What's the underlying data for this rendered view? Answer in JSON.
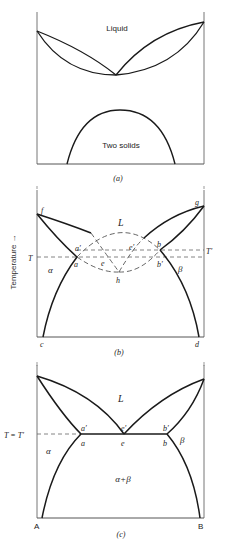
{
  "figure": {
    "panels": [
      {
        "id": "a",
        "caption": "(a)",
        "labels": {
          "liquid": "Liquid",
          "two_solids": "Two solids"
        }
      },
      {
        "id": "b",
        "caption": "(b)",
        "axis_label": "Temperature →",
        "labels": {
          "L": "L",
          "alpha": "α",
          "beta": "β",
          "T": "T",
          "T_prime": "T′",
          "f": "f",
          "g": "g",
          "c": "c",
          "d": "d",
          "a": "a",
          "a_prime": "a′",
          "b": "b",
          "b_prime": "b′",
          "e": "e",
          "e_prime": "e′",
          "h": "h"
        }
      },
      {
        "id": "c",
        "caption": "(c)",
        "labels": {
          "L": "L",
          "alpha": "α",
          "beta": "β",
          "alpha_beta": "α+β",
          "T_eq": "T = T′",
          "a": "a",
          "a_prime": "a′",
          "e": "e",
          "e_prime": "e′",
          "b": "b",
          "b_prime": "b′",
          "A": "A",
          "B": "B"
        }
      }
    ],
    "colors": {
      "line": "#1a1a1a",
      "dashed": "#555555",
      "frame": "#777777",
      "text": "#222222"
    }
  }
}
